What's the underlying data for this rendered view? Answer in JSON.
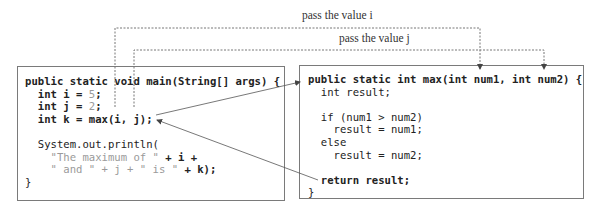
{
  "labels": {
    "pass_i": "pass the value i",
    "pass_j": "pass the value j"
  },
  "main_method": {
    "lines": [
      [
        {
          "t": "public static void main(String[] args) {",
          "c": "kw"
        }
      ],
      [
        {
          "t": "  int i = ",
          "c": "kw"
        },
        {
          "t": "5",
          "c": "lit"
        },
        {
          "t": ";",
          "c": "kw"
        }
      ],
      [
        {
          "t": "  int j = ",
          "c": "kw"
        },
        {
          "t": "2",
          "c": "lit"
        },
        {
          "t": ";",
          "c": "kw"
        }
      ],
      [
        {
          "t": "  int k = max(i, j);",
          "c": "kw"
        }
      ],
      [
        {
          "t": "",
          "c": ""
        }
      ],
      [
        {
          "t": "  System.out.println(",
          "c": ""
        }
      ],
      [
        {
          "t": "    \"The maximum of \"",
          "c": "lit"
        },
        {
          "t": " + i +",
          "c": "kw"
        }
      ],
      [
        {
          "t": "    \" and \" + j + \" is \"",
          "c": "lit"
        },
        {
          "t": " + k);",
          "c": "kw"
        }
      ],
      [
        {
          "t": "}",
          "c": ""
        }
      ]
    ]
  },
  "max_method": {
    "lines": [
      [
        {
          "t": "public static int max(int num1, int num2) {",
          "c": "kw"
        }
      ],
      [
        {
          "t": "  int result;",
          "c": ""
        }
      ],
      [
        {
          "t": "",
          "c": ""
        }
      ],
      [
        {
          "t": "  if (num1 > num2)",
          "c": ""
        }
      ],
      [
        {
          "t": "    result = num1;",
          "c": ""
        }
      ],
      [
        {
          "t": "  else",
          "c": ""
        }
      ],
      [
        {
          "t": "    result = num2;",
          "c": ""
        }
      ],
      [
        {
          "t": "",
          "c": ""
        }
      ],
      [
        {
          "t": "  return result;",
          "c": "kw"
        }
      ],
      [
        {
          "t": "}",
          "c": ""
        }
      ]
    ]
  },
  "colors": {
    "border": "#7a7a7a",
    "text": "#222222",
    "literal": "#9a9a9a",
    "arrow": "#555555"
  }
}
